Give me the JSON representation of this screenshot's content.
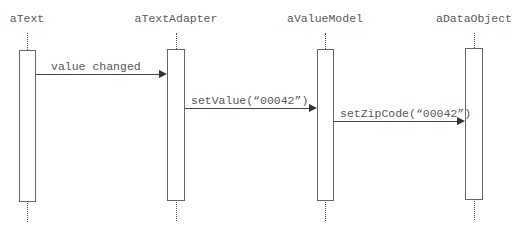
{
  "diagram": {
    "type": "sequence",
    "objects": [
      {
        "name": "aText",
        "center_x": 27
      },
      {
        "name": "aTextAdapter",
        "center_x": 176
      },
      {
        "name": "aValueModel",
        "center_x": 325
      },
      {
        "name": "aDataObject",
        "center_x": 474
      }
    ],
    "messages": [
      {
        "from": "aText",
        "to": "aTextAdapter",
        "label": "value changed"
      },
      {
        "from": "aTextAdapter",
        "to": "aValueModel",
        "label": "setValue(“00042”)"
      },
      {
        "from": "aValueModel",
        "to": "aDataObject",
        "label": "setZipCode(“00042”)"
      }
    ],
    "colors": {
      "line": "#444444",
      "text": "#5a5a5a",
      "background": "#ffffff"
    }
  }
}
